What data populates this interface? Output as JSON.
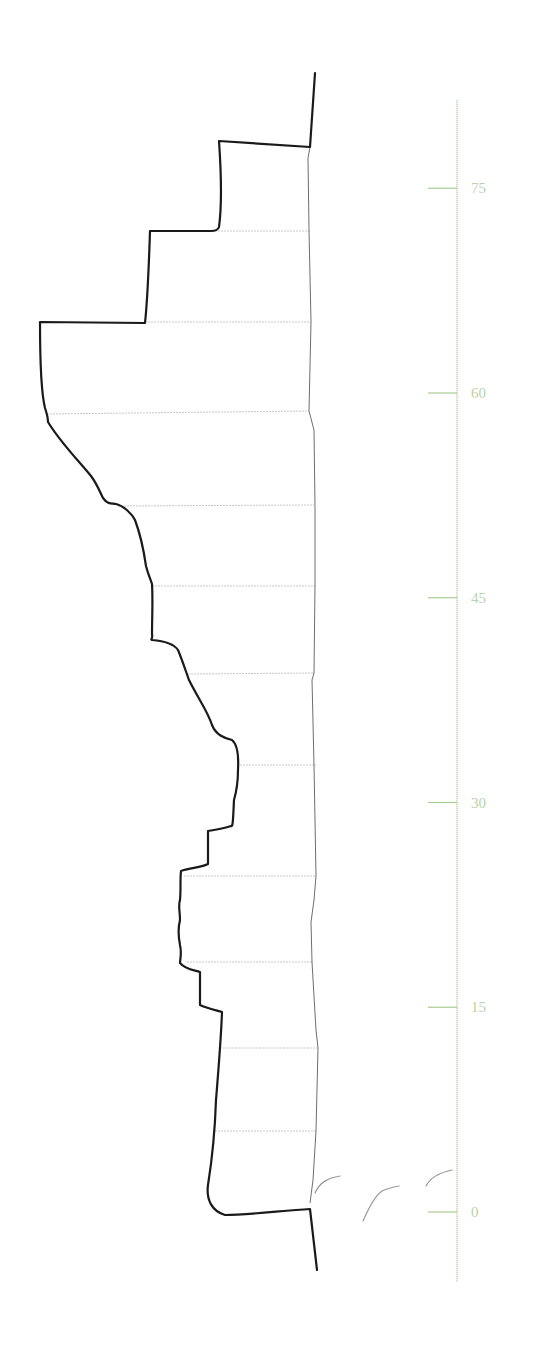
{
  "figure": {
    "type": "archaeological-section-profile",
    "colors": {
      "outer_profile": "#1a1a1a",
      "inner_profile": "#6e6e6e",
      "layer_lines": "#c8c8c8",
      "scale": "#a9cc95",
      "scale_labels": "#b9d3a8",
      "faint_strokes": "#9a9a9a"
    }
  },
  "scale": {
    "unit_px": 13.65,
    "zero_y": 1212,
    "x": 457,
    "top_y": 100,
    "bottom_y": 1282,
    "ticks": [
      {
        "value": 75,
        "label": "75"
      },
      {
        "value": 60,
        "label": "60"
      },
      {
        "value": 45,
        "label": "45"
      },
      {
        "value": 30,
        "label": "30"
      },
      {
        "value": 15,
        "label": "15"
      },
      {
        "value": 0,
        "label": "0"
      }
    ]
  },
  "layer_lines_y": [
    231,
    322,
    414,
    506,
    586,
    674,
    765,
    876,
    962,
    1048,
    1131
  ]
}
